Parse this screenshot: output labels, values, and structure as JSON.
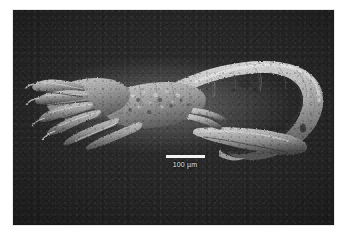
{
  "figure": {
    "type": "sem-micrograph",
    "alt": "Scanning electron micrograph of an elongate arthropod larva, branched appendages at left, curved segmented abdomen at right",
    "background_color": "#ffffff",
    "plate_color": "#252525",
    "specimen_color": "#c9c9c9"
  },
  "scale_bar": {
    "label": "100 µm",
    "value": 100,
    "unit": "µm",
    "bar_length_px": 39,
    "color": "#f2f2f2"
  }
}
